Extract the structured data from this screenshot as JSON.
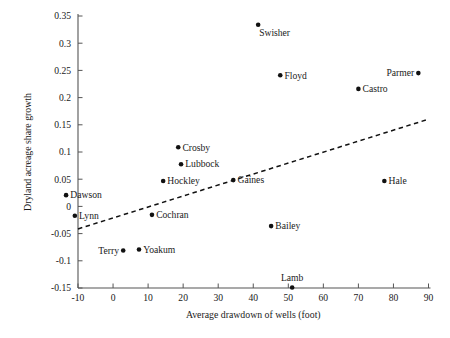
{
  "chart_data": {
    "type": "scatter",
    "title": "",
    "xlabel": "Average drawdown of wells (foot)",
    "ylabel": "Dryland acreage share growth",
    "xlim": [
      -10,
      90
    ],
    "ylim": [
      -0.15,
      0.35
    ],
    "xticks": [
      "-10",
      "0",
      "10",
      "20",
      "30",
      "40",
      "50",
      "60",
      "70",
      "80",
      "90"
    ],
    "yticks": [
      "0.35",
      "0.3",
      "0.25",
      "0.2",
      "0.15",
      "0.1",
      "0.05",
      "0",
      "-0.05",
      "-0.1",
      "-0.15"
    ],
    "grid": false,
    "legend": "none",
    "point_color": "#111111",
    "trendline": {
      "style": "dashed",
      "color": "#111111",
      "x_start": -10,
      "y_start": -0.0414,
      "x_end": 90,
      "y_end": 0.1603
    },
    "points": [
      {
        "label": "Swisher",
        "x": 41.4,
        "y": 0.334,
        "label_pos": "below-right"
      },
      {
        "label": "Floyd",
        "x": 47.7,
        "y": 0.241,
        "label_pos": "right"
      },
      {
        "label": "Parmer",
        "x": 87.1,
        "y": 0.245,
        "label_pos": "left"
      },
      {
        "label": "Castro",
        "x": 70.0,
        "y": 0.216,
        "label_pos": "right"
      },
      {
        "label": "Crosby",
        "x": 18.6,
        "y": 0.1086,
        "label_pos": "right"
      },
      {
        "label": "Lubbock",
        "x": 19.4,
        "y": 0.0776,
        "label_pos": "right"
      },
      {
        "label": "Hockley",
        "x": 14.3,
        "y": 0.0466,
        "label_pos": "right"
      },
      {
        "label": "Hale",
        "x": 77.4,
        "y": 0.0466,
        "label_pos": "right"
      },
      {
        "label": "Gaines",
        "x": 34.3,
        "y": 0.0483,
        "label_pos": "right"
      },
      {
        "label": "Dawson",
        "x": -13.4,
        "y": 0.0207,
        "label_pos": "right"
      },
      {
        "label": "Cochran",
        "x": 11.1,
        "y": -0.0155,
        "label_pos": "right"
      },
      {
        "label": "Lynn",
        "x": -10.9,
        "y": -0.0172,
        "label_pos": "right"
      },
      {
        "label": "Bailey",
        "x": 45.1,
        "y": -0.0362,
        "label_pos": "right"
      },
      {
        "label": "Terry",
        "x": 2.9,
        "y": -0.081,
        "label_pos": "left"
      },
      {
        "label": "Yoakum",
        "x": 7.4,
        "y": -0.0793,
        "label_pos": "right"
      },
      {
        "label": "Lamb",
        "x": 51.1,
        "y": -0.149,
        "label_pos": "above"
      }
    ]
  }
}
